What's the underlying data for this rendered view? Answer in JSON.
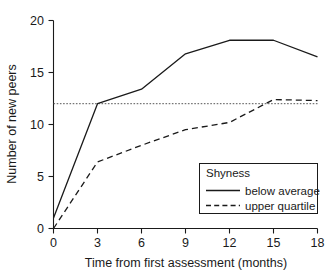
{
  "chart_data": {
    "type": "line",
    "title": "",
    "xlabel": "Time from first assessment (months)",
    "ylabel": "Number of new peers",
    "x": [
      0,
      3,
      6,
      9,
      12,
      15,
      18
    ],
    "xticks": [
      "0",
      "3",
      "6",
      "9",
      "12",
      "15",
      "18"
    ],
    "yticks": [
      "0",
      "5",
      "10",
      "15",
      "20"
    ],
    "xlim": [
      0,
      18
    ],
    "ylim": [
      0,
      20
    ],
    "grid": false,
    "legend_position": "lower-right",
    "legend_title": "Shyness",
    "series": [
      {
        "name": "below average",
        "style": "solid",
        "x": [
          0,
          3,
          6,
          9,
          12,
          15,
          18
        ],
        "values": [
          1.0,
          12.0,
          13.4,
          16.8,
          18.1,
          18.1,
          16.5
        ]
      },
      {
        "name": "upper quartile",
        "style": "dashed",
        "x": [
          0,
          3,
          6,
          9,
          12,
          15,
          18
        ],
        "values": [
          0.0,
          6.4,
          8.0,
          9.5,
          10.2,
          12.4,
          12.3
        ]
      }
    ],
    "reference_line": {
      "name": "reference",
      "style": "dotted",
      "value": 12.0,
      "orientation": "horizontal"
    },
    "colors": {
      "axis": "#1a1a1a",
      "series": "#1a1a1a",
      "reference": "#555555",
      "background": "#ffffff"
    }
  }
}
